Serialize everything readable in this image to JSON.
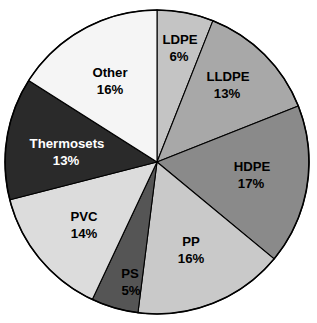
{
  "chart_data": {
    "type": "pie",
    "title": "",
    "subtitle": "",
    "xlabel": "",
    "ylabel": "",
    "grid": false,
    "legend_position": "none",
    "labels_inside_slices": true,
    "start_angle_deg": 0,
    "direction": "clockwise",
    "total_percent": 100,
    "geometry": {
      "center_x": 157,
      "center_y": 162,
      "radius": 152
    },
    "categories": [
      "LDPE",
      "LLDPE",
      "HDPE",
      "PP",
      "PS",
      "PVC",
      "Thermosets",
      "Other"
    ],
    "values": [
      6,
      13,
      17,
      16,
      5,
      14,
      13,
      16
    ],
    "value_suffix": "%",
    "slices": [
      {
        "label": "LDPE",
        "value": 6,
        "value_text": "6%",
        "color": "#c4c4c4",
        "text_color": "#000000",
        "text_class": "dark-text",
        "label_x": 180,
        "label_y": 41,
        "value_x": 179,
        "value_y": 58
      },
      {
        "label": "LLDPE",
        "value": 13,
        "value_text": "13%",
        "color": "#a8a8a8",
        "text_color": "#000000",
        "text_class": "dark-text",
        "label_x": 228,
        "label_y": 78,
        "value_x": 227,
        "value_y": 95
      },
      {
        "label": "HDPE",
        "value": 17,
        "value_text": "17%",
        "color": "#8a8a8a",
        "text_color": "#000000",
        "text_class": "dark-text",
        "label_x": 252,
        "label_y": 168,
        "value_x": 251,
        "value_y": 185
      },
      {
        "label": "PP",
        "value": 16,
        "value_text": "16%",
        "color": "#c9c9c9",
        "text_color": "#000000",
        "text_class": "dark-text",
        "label_x": 191,
        "label_y": 243,
        "value_x": 191,
        "value_y": 260
      },
      {
        "label": "PS",
        "value": 5,
        "value_text": "5%",
        "color": "#555555",
        "text_color": "#000000",
        "text_class": "dark-text",
        "label_x": 130,
        "label_y": 275,
        "value_x": 131,
        "value_y": 292
      },
      {
        "label": "PVC",
        "value": 14,
        "value_text": "14%",
        "color": "#dcdcdc",
        "text_color": "#000000",
        "text_class": "dark-text",
        "label_x": 84,
        "label_y": 218,
        "value_x": 84,
        "value_y": 235
      },
      {
        "label": "Thermosets",
        "value": 13,
        "value_text": "13%",
        "color": "#2a2a2a",
        "text_color": "#ffffff",
        "text_class": "light-text",
        "label_x": 67,
        "label_y": 145,
        "value_x": 66,
        "value_y": 162
      },
      {
        "label": "Other",
        "value": 16,
        "value_text": "16%",
        "color": "#f5f5f5",
        "text_color": "#000000",
        "text_class": "dark-text",
        "label_x": 110,
        "label_y": 74,
        "value_x": 110,
        "value_y": 91
      }
    ]
  }
}
